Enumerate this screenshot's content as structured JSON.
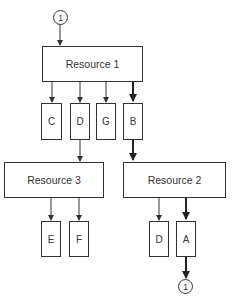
{
  "diagram": {
    "connectors": {
      "top": {
        "label": "1"
      },
      "bottom": {
        "label": "1"
      }
    },
    "resources": {
      "r1": {
        "label": "Resource 1"
      },
      "r2": {
        "label": "Resource 2"
      },
      "r3": {
        "label": "Resource 3"
      }
    },
    "items": {
      "r1_c": {
        "label": "C"
      },
      "r1_d": {
        "label": "D"
      },
      "r1_g": {
        "label": "G"
      },
      "r1_b": {
        "label": "B"
      },
      "r3_e": {
        "label": "E"
      },
      "r3_f": {
        "label": "F"
      },
      "r2_d": {
        "label": "D"
      },
      "r2_a": {
        "label": "A"
      }
    },
    "edges": [
      {
        "from": "connector-top",
        "to": "Resource 1"
      },
      {
        "from": "Resource 1",
        "to": "C"
      },
      {
        "from": "Resource 1",
        "to": "D"
      },
      {
        "from": "Resource 1",
        "to": "G"
      },
      {
        "from": "Resource 1",
        "to": "B",
        "bold": true
      },
      {
        "from": "D",
        "to": "Resource 3"
      },
      {
        "from": "B",
        "to": "Resource 2",
        "bold": true
      },
      {
        "from": "Resource 3",
        "to": "E"
      },
      {
        "from": "Resource 3",
        "to": "F"
      },
      {
        "from": "Resource 2",
        "to": "D"
      },
      {
        "from": "Resource 2",
        "to": "A",
        "bold": true
      },
      {
        "from": "A",
        "to": "connector-bottom",
        "bold": true
      }
    ]
  }
}
